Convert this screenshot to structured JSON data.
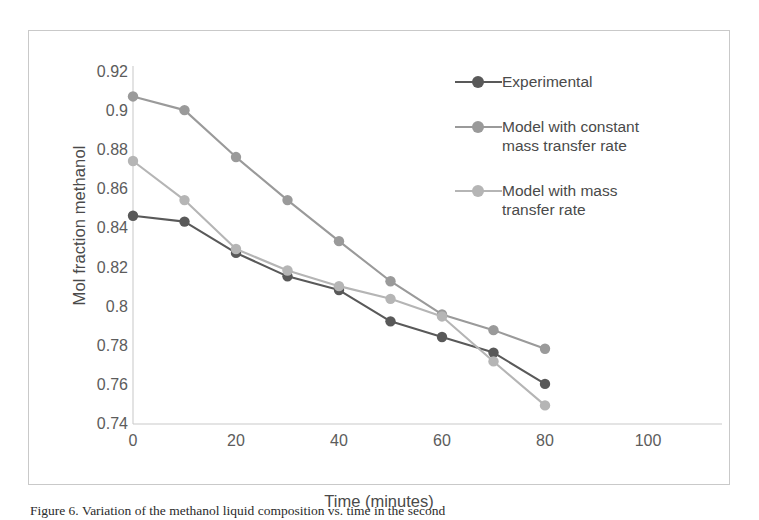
{
  "chart_data": {
    "type": "line",
    "title": "",
    "xlabel": "Time (minutes)",
    "ylabel": "Mol fraction methanol",
    "xlim": [
      0,
      100
    ],
    "ylim": [
      0.74,
      0.92
    ],
    "xticks": [
      0,
      20,
      40,
      60,
      80,
      100
    ],
    "xtick_labels": [
      "0",
      "20",
      "40",
      "60",
      "80",
      "100"
    ],
    "yticks": [
      0.74,
      0.76,
      0.78,
      0.8,
      0.82,
      0.84,
      0.86,
      0.88,
      0.9,
      0.92
    ],
    "ytick_labels": [
      "0.74",
      "0.76",
      "0.78",
      "0.8",
      "0.82",
      "0.84",
      "0.86",
      "0.88",
      "0.9",
      "0.92"
    ],
    "grid": false,
    "legend_position": "inside-upper-right",
    "x": [
      0,
      10,
      20,
      30,
      40,
      50,
      60,
      70,
      80
    ],
    "series": [
      {
        "name": "Experimental",
        "color": "#595959",
        "marker": "circle",
        "values": [
          0.8465,
          0.8435,
          0.8275,
          0.8155,
          0.8085,
          0.7925,
          0.7845,
          0.7765,
          0.7605
        ]
      },
      {
        "name": "Model with constant\nmass transfer rate",
        "color": "#9a9a9a",
        "marker": "circle",
        "values": [
          0.9075,
          0.9005,
          0.8765,
          0.8545,
          0.8335,
          0.813,
          0.796,
          0.788,
          0.7785
        ]
      },
      {
        "name": "Model with mass\ntransfer rate",
        "color": "#b5b5b5",
        "marker": "circle",
        "values": [
          0.8745,
          0.8545,
          0.8295,
          0.8185,
          0.8105,
          0.804,
          0.795,
          0.772,
          0.7495
        ]
      }
    ]
  },
  "legend": {
    "items": [
      {
        "label": "Experimental"
      },
      {
        "label": "Model with constant\nmass transfer rate"
      },
      {
        "label": "Model with mass\ntransfer rate"
      }
    ]
  },
  "caption": {
    "text": "Figure 6. Variation of the methanol liquid composition vs. time in the second"
  }
}
